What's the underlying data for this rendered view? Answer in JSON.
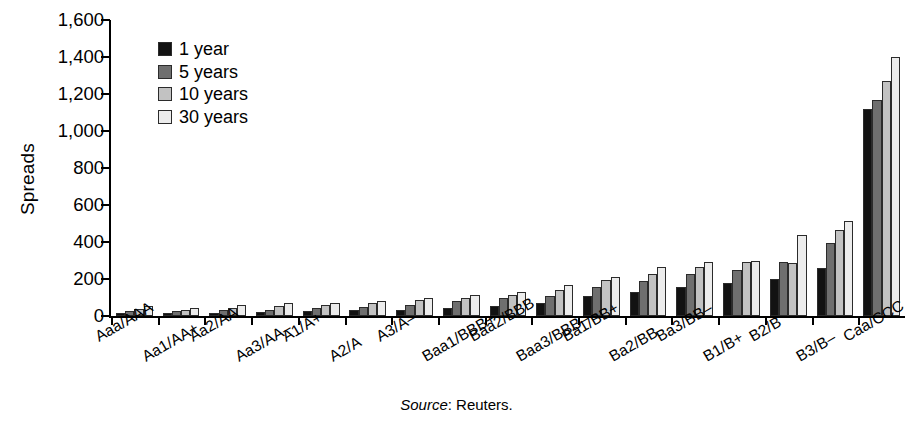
{
  "figure": {
    "source_note_label": "Source",
    "source_note_value": ": Reuters."
  },
  "legend": {
    "position": "upper-left-inside",
    "items": [
      {
        "label": "1 year",
        "color": "#121212"
      },
      {
        "label": "5 years",
        "color": "#6f6f6f"
      },
      {
        "label": "10 years",
        "color": "#c2c2c2"
      },
      {
        "label": "30 years",
        "color": "#ececec"
      }
    ]
  },
  "chart_data": {
    "type": "bar",
    "title": "",
    "subtitle": "",
    "xlabel": "",
    "ylabel": "Spreads",
    "ylim": [
      0,
      1600
    ],
    "ytick_values": [
      0,
      200,
      400,
      600,
      800,
      1000,
      1200,
      1400,
      1600
    ],
    "ytick_labels": [
      "0",
      "200",
      "400",
      "600",
      "800",
      "1,000",
      "1,200",
      "1,400",
      "1,600"
    ],
    "grid": false,
    "legend_position": "upper left",
    "categories": [
      "Aaa/AAA",
      "Aa1/AA+",
      "Aa2/AA",
      "Aa3/AA–",
      "A1/A+",
      "A2/A",
      "A3/A–",
      "Baa1/BBB+",
      "Baa2/BBB",
      "Baa3/BBB–",
      "Ba1/BB+",
      "Ba2/BB",
      "Ba3/BB–",
      "B1/B+",
      "B2/B",
      "B3/B–",
      "Caa/CCC"
    ],
    "series": [
      {
        "name": "1 year",
        "color": "#121212",
        "values": [
          15,
          15,
          18,
          20,
          25,
          30,
          35,
          45,
          55,
          70,
          110,
          130,
          155,
          180,
          200,
          260,
          1120
        ]
      },
      {
        "name": "5 years",
        "color": "#6f6f6f",
        "values": [
          25,
          25,
          30,
          35,
          45,
          50,
          60,
          80,
          95,
          110,
          155,
          190,
          225,
          250,
          290,
          395,
          1165
        ]
      },
      {
        "name": "10 years",
        "color": "#c2c2c2",
        "values": [
          40,
          35,
          45,
          55,
          60,
          70,
          85,
          100,
          115,
          140,
          195,
          225,
          265,
          290,
          285,
          465,
          1270
        ]
      },
      {
        "name": "30 years",
        "color": "#ececec",
        "values": [
          55,
          45,
          58,
          70,
          70,
          80,
          100,
          115,
          130,
          165,
          210,
          265,
          290,
          300,
          440,
          515,
          1400
        ]
      }
    ]
  }
}
